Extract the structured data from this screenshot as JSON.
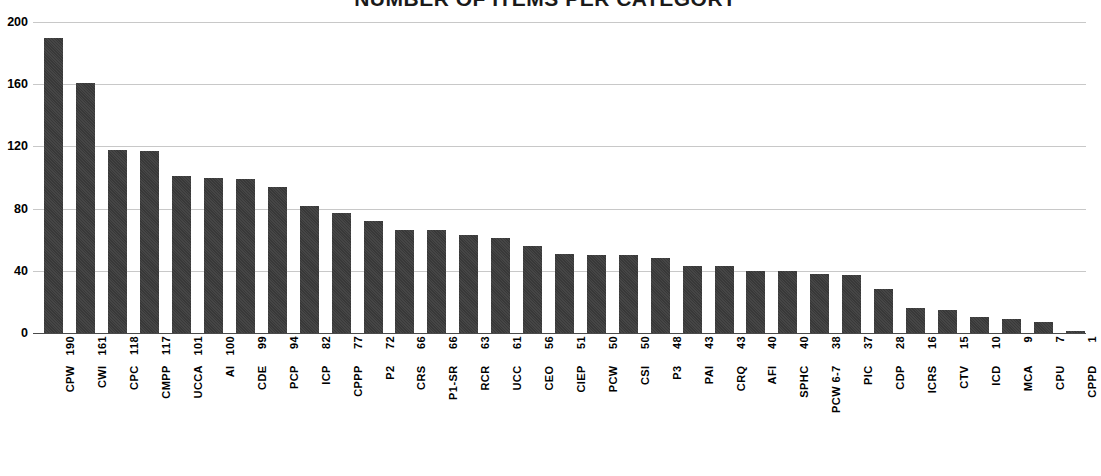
{
  "chart_data": {
    "type": "bar",
    "title": "NUMBER OF ITEMS PER CATEGORY",
    "xlabel": "",
    "ylabel": "",
    "ylim": [
      0,
      200
    ],
    "yticks": [
      0,
      40,
      80,
      120,
      160,
      200
    ],
    "grid": true,
    "legend": false,
    "orientation": "vertical",
    "bar_color": "#3c3c3c",
    "gridline_color": "#c8c8c8",
    "axis_color": "#4a4a4a",
    "background": "#ffffff",
    "categories": [
      "CPW",
      "CWI",
      "CPC",
      "CMPP",
      "UCCA",
      "AI",
      "CDE",
      "PCP",
      "ICP",
      "CPPP",
      "P2",
      "CRS",
      "P1-SR",
      "RCR",
      "UCC",
      "CEO",
      "CIEP",
      "PCW",
      "CSI",
      "P3",
      "PAI",
      "CRQ",
      "AFI",
      "SPHC",
      "PCW 6-7",
      "PIC",
      "CDP",
      "ICRS",
      "CTV",
      "ICD",
      "MCA",
      "CPU",
      "CPPD"
    ],
    "values": [
      190,
      161,
      118,
      117,
      101,
      100,
      99,
      94,
      82,
      77,
      72,
      66,
      66,
      63,
      61,
      56,
      51,
      50,
      50,
      48,
      43,
      43,
      40,
      40,
      38,
      37,
      28,
      16,
      15,
      10,
      9,
      7,
      1
    ],
    "tick_labels": [
      "CPW 190",
      "CWI 161",
      "CPC 118",
      "CMPP 117",
      "UCCA 101",
      "AI 100",
      "CDE 99",
      "PCP 94",
      "ICP 82",
      "CPPP 77",
      "P2 72",
      "CRS 66",
      "P1-SR 66",
      "RCR 63",
      "UCC 61",
      "CEO 56",
      "CIEP 51",
      "PCW 50",
      "CSI 50",
      "P3 48",
      "PAI 43",
      "CRQ 43",
      "AFI 40",
      "SPHC 40",
      "PCW 6-7 38",
      "PIC 37",
      "CDP 28",
      "ICRS 16",
      "CTV 15",
      "ICD 10",
      "MCA 9",
      "CPU 7",
      "CPPD 1"
    ]
  }
}
